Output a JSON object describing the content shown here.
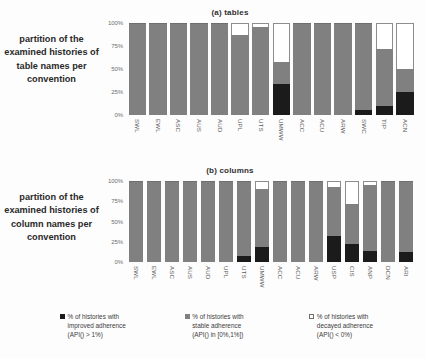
{
  "chart_data": [
    {
      "type": "bar",
      "title": "(a) tables",
      "subtitle": "",
      "caption": "partition of the examined histories of table names per convention",
      "xlabel": "",
      "ylabel": "",
      "ylim": [
        0,
        100
      ],
      "ytick_labels": [
        "100%",
        "75%",
        "50%",
        "25%",
        "0%"
      ],
      "ytick_values": [
        100,
        75,
        50,
        25,
        0
      ],
      "grid": false,
      "stacked": true,
      "legend_position": "bottom",
      "categories": [
        "SWL",
        "EWL",
        "ASC",
        "AUS",
        "AUD",
        "UPL",
        "UTS",
        "UMWW",
        "ACC",
        "ACU",
        "ARW",
        "SWC",
        "TIP",
        "ACN"
      ],
      "series": [
        {
          "name": "% of histories with improved adherence (API() > 1%)",
          "color": "#1b1b1b",
          "values": [
            0,
            0,
            0,
            0,
            0,
            0,
            0,
            34,
            0,
            0,
            0,
            5,
            10,
            25
          ]
        },
        {
          "name": "% of histories with stable adherence (API() in [0%,1%])",
          "color": "#808080",
          "values": [
            100,
            100,
            100,
            100,
            100,
            87,
            96,
            24,
            100,
            100,
            100,
            95,
            62,
            25
          ]
        },
        {
          "name": "% of histories with decayed adherence (API() < 0%)",
          "color": "#ffffff",
          "values": [
            0,
            0,
            0,
            0,
            0,
            13,
            4,
            42,
            0,
            0,
            0,
            0,
            28,
            50
          ]
        }
      ]
    },
    {
      "type": "bar",
      "title": "(b) columns",
      "subtitle": "",
      "caption": "partition of the examined histories of column names per convention",
      "xlabel": "",
      "ylabel": "",
      "ylim": [
        0,
        100
      ],
      "ytick_labels": [
        "100%",
        "75%",
        "50%",
        "25%",
        "0%"
      ],
      "ytick_values": [
        100,
        75,
        50,
        25,
        0
      ],
      "grid": false,
      "stacked": true,
      "legend_position": "bottom",
      "categories": [
        "SWL",
        "EWL",
        "ASC",
        "AUS",
        "AUD",
        "UPL",
        "UTS",
        "UMWW",
        "ACC",
        "ACU",
        "ARW",
        "USP",
        "CIS",
        "ANP",
        "DCN",
        "ARI"
      ],
      "series": [
        {
          "name": "% of histories with improved adherence (API() > 1%)",
          "color": "#1b1b1b",
          "values": [
            0,
            0,
            0,
            0,
            0,
            0,
            8,
            18,
            0,
            0,
            0,
            32,
            22,
            14,
            0,
            12
          ]
        },
        {
          "name": "% of histories with stable adherence (API() in [0%,1%])",
          "color": "#808080",
          "values": [
            100,
            100,
            100,
            100,
            100,
            100,
            92,
            72,
            100,
            100,
            100,
            61,
            50,
            81,
            100,
            88
          ]
        },
        {
          "name": "% of histories with decayed adherence (API() < 0%)",
          "color": "#ffffff",
          "values": [
            0,
            0,
            0,
            0,
            0,
            0,
            0,
            10,
            0,
            0,
            0,
            7,
            28,
            5,
            0,
            0
          ]
        }
      ]
    }
  ],
  "panels": [
    {
      "id": "a",
      "title": "(a) tables",
      "caption": "partition of the examined histories of table names per convention"
    },
    {
      "id": "b",
      "title": "(b) columns",
      "caption": "partition of the examined histories of column names per convention"
    }
  ],
  "legend": {
    "items": [
      {
        "swatch": "improved",
        "line1": "% of histories with",
        "line2": "improved adherence",
        "line3": "(API() > 1%)",
        "color": "#1b1b1b"
      },
      {
        "swatch": "stable",
        "line1": "% of histories with",
        "line2": "stable adherence",
        "line3": "(API() in [0%,1%])",
        "color": "#808080"
      },
      {
        "swatch": "decayed",
        "line1": "% of histories with",
        "line2": "decayed adherence",
        "line3": "(API() < 0%)",
        "color": "#ffffff"
      }
    ]
  }
}
